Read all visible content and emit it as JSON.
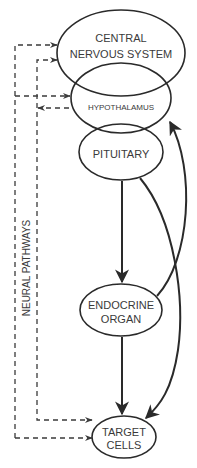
{
  "diagram": {
    "nodes": [
      {
        "id": "cns",
        "lines": [
          "CENTRAL",
          "NERVOUS SYSTEM"
        ]
      },
      {
        "id": "hypothalamus",
        "lines": [
          "HYPOTHALAMUS"
        ]
      },
      {
        "id": "pituitary",
        "lines": [
          "PITUITARY"
        ]
      },
      {
        "id": "endocrine",
        "lines": [
          "ENDOCRINE",
          "ORGAN"
        ]
      },
      {
        "id": "target",
        "lines": [
          "TARGET",
          "CELLS"
        ]
      }
    ],
    "side_label": "NEURAL PATHWAYS",
    "edges": [
      {
        "from": "pituitary",
        "to": "endocrine",
        "style": "solid"
      },
      {
        "from": "pituitary",
        "to": "target",
        "style": "solid"
      },
      {
        "from": "endocrine",
        "to": "hypothalamus",
        "style": "solid"
      },
      {
        "from": "endocrine",
        "to": "target",
        "style": "solid"
      },
      {
        "from": "neural-outer",
        "to": "cns",
        "style": "dashed"
      },
      {
        "from": "cns",
        "to": "neural-inner",
        "style": "dashed"
      },
      {
        "from": "neural-outer",
        "to": "hypothalamus",
        "style": "dashed"
      },
      {
        "from": "hypothalamus",
        "to": "neural-inner",
        "style": "dashed"
      },
      {
        "from": "neural-inner",
        "to": "target",
        "style": "dashed"
      },
      {
        "from": "target",
        "to": "neural-outer",
        "style": "dashed"
      }
    ],
    "colors": {
      "stroke": "#2a2a2a",
      "text": "#3a3a3a",
      "background": "#ffffff"
    }
  }
}
